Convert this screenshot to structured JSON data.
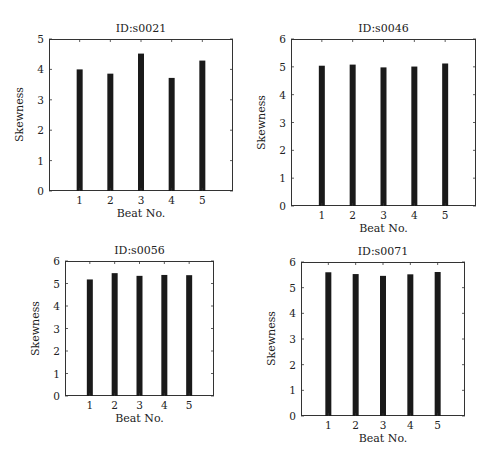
{
  "chart_data": [
    {
      "type": "bar",
      "title": "ID:s0021",
      "xlabel": "Beat No.",
      "ylabel": "Skewness",
      "categories": [
        "1",
        "2",
        "3",
        "4",
        "5"
      ],
      "values": [
        4.0,
        3.86,
        4.52,
        3.72,
        4.29
      ],
      "ylim": [
        0,
        5
      ],
      "yticks": [
        "0",
        "1",
        "2",
        "3",
        "4",
        "5"
      ],
      "grid": false,
      "bar_color": "#1a1a1a"
    },
    {
      "type": "bar",
      "title": "ID:s0046",
      "xlabel": "Beat No.",
      "ylabel": "Skewness",
      "categories": [
        "1",
        "2",
        "3",
        "4",
        "5"
      ],
      "values": [
        5.04,
        5.08,
        4.98,
        5.01,
        5.12
      ],
      "ylim": [
        0,
        6
      ],
      "yticks": [
        "0",
        "1",
        "2",
        "3",
        "4",
        "5",
        "6"
      ],
      "grid": false,
      "bar_color": "#1a1a1a"
    },
    {
      "type": "bar",
      "title": "ID:s0056",
      "xlabel": "Beat No.",
      "ylabel": "Skewness",
      "categories": [
        "1",
        "2",
        "3",
        "4",
        "5"
      ],
      "values": [
        5.18,
        5.46,
        5.34,
        5.38,
        5.37
      ],
      "ylim": [
        0,
        6
      ],
      "yticks": [
        "0",
        "1",
        "2",
        "3",
        "4",
        "5",
        "6"
      ],
      "grid": false,
      "bar_color": "#1a1a1a"
    },
    {
      "type": "bar",
      "title": "ID:s0071",
      "xlabel": "Beat No.",
      "ylabel": "Skewness",
      "categories": [
        "1",
        "2",
        "3",
        "4",
        "5"
      ],
      "values": [
        5.6,
        5.53,
        5.46,
        5.52,
        5.61
      ],
      "ylim": [
        0,
        6
      ],
      "yticks": [
        "0",
        "1",
        "2",
        "3",
        "4",
        "5",
        "6"
      ],
      "grid": false,
      "bar_color": "#1a1a1a"
    }
  ],
  "layout": [
    {
      "left": 49,
      "top": 39,
      "width": 184,
      "height": 152
    },
    {
      "left": 291,
      "top": 39,
      "width": 185,
      "height": 167
    },
    {
      "left": 65,
      "top": 261,
      "width": 149,
      "height": 135
    },
    {
      "left": 301,
      "top": 262,
      "width": 164,
      "height": 154
    }
  ]
}
